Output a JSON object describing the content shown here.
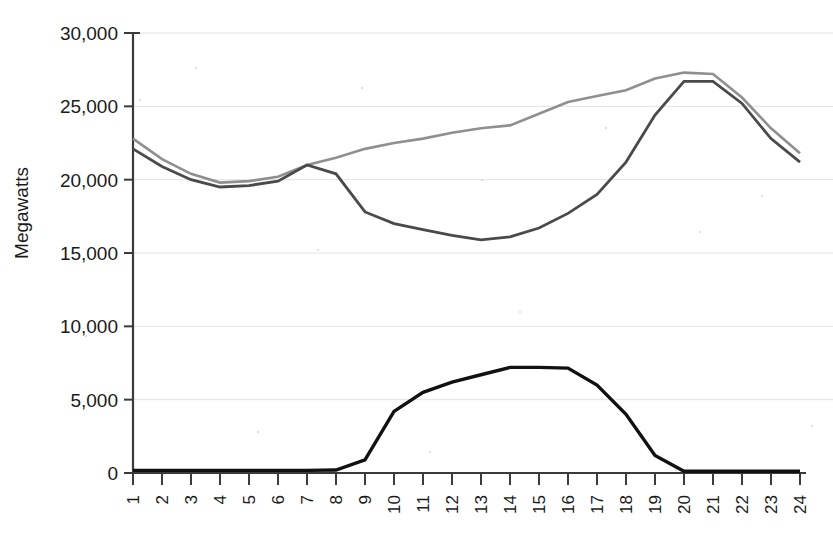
{
  "chart_data": {
    "type": "line",
    "title": "",
    "xlabel": "",
    "ylabel": "Megawatts",
    "x": [
      1,
      2,
      3,
      4,
      5,
      6,
      7,
      8,
      9,
      10,
      11,
      12,
      13,
      14,
      15,
      16,
      17,
      18,
      19,
      20,
      21,
      22,
      23,
      24
    ],
    "xtick_labels": [
      "1",
      "2",
      "3",
      "4",
      "5",
      "6",
      "7",
      "8",
      "9",
      "10",
      "11",
      "12",
      "13",
      "14",
      "15",
      "16",
      "17",
      "18",
      "19",
      "20",
      "21",
      "22",
      "23",
      "24"
    ],
    "ytick_labels": [
      "0",
      "5,000",
      "10,000",
      "15,000",
      "20,000",
      "25,000",
      "30,000"
    ],
    "ytick_values": [
      0,
      5000,
      10000,
      15000,
      20000,
      25000,
      30000
    ],
    "ylim": [
      0,
      30000
    ],
    "xlim": [
      1,
      24
    ],
    "grid": true,
    "legend": "none",
    "series": [
      {
        "name": "total-load",
        "color": "#8f8f8f",
        "width": 2.6,
        "values": [
          22800,
          21400,
          20400,
          19800,
          19900,
          20200,
          21000,
          21500,
          22100,
          22500,
          22800,
          23200,
          23500,
          23700,
          24500,
          25300,
          25700,
          26100,
          26900,
          27300,
          27200,
          25600,
          23500,
          21800
        ]
      },
      {
        "name": "net-load",
        "color": "#4a4a4a",
        "width": 2.8,
        "values": [
          22100,
          20900,
          20000,
          19500,
          19600,
          19900,
          21000,
          20400,
          17800,
          17000,
          16600,
          16200,
          15900,
          16100,
          16700,
          17700,
          19000,
          21200,
          24400,
          26700,
          26700,
          25200,
          22800,
          21200
        ]
      },
      {
        "name": "solar-generation",
        "color": "#111111",
        "width": 3.4,
        "values": [
          180,
          180,
          180,
          180,
          180,
          180,
          180,
          200,
          900,
          4200,
          5500,
          6200,
          6700,
          7200,
          7200,
          7150,
          6000,
          4000,
          1200,
          120,
          120,
          120,
          120,
          120
        ]
      }
    ]
  },
  "plot_geometry": {
    "left": 133,
    "right": 800,
    "top": 33,
    "bottom": 473
  }
}
